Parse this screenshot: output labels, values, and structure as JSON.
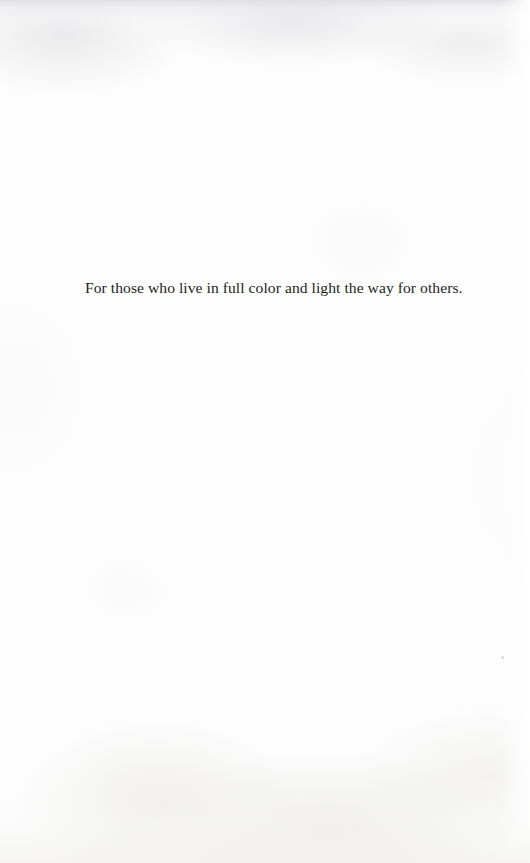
{
  "page": {
    "kind": "book-dedication-page",
    "width": 530,
    "height": 863,
    "background_color": "#fdfdfd",
    "text_color": "#231f20"
  },
  "dedication": {
    "text": "For those who live in full color and light the way for others."
  }
}
